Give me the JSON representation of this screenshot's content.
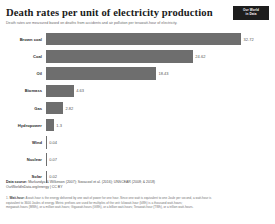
{
  "header": {
    "title": "Death rates per unit of electricity production",
    "subtitle": "Death rates are measured based on deaths from accidents and air pollution per terawatt-hour of electricity.",
    "logo_line1": "Our World",
    "logo_line2": "in Data"
  },
  "chart_data": {
    "type": "bar",
    "orientation": "horizontal",
    "title": "Death rates per unit of electricity production",
    "subtitle": "Death rates are measured based on deaths from accidents and air pollution per terawatt-hour of electricity.",
    "xlabel": "",
    "ylabel": "",
    "grid": false,
    "legend": "none",
    "xlim": [
      0,
      32.72
    ],
    "bar_color": "#6e6e6e",
    "categories": [
      "Brown coal",
      "Coal",
      "Oil",
      "Biomass",
      "Gas",
      "Hydropower",
      "Wind",
      "Nuclear",
      "Solar"
    ],
    "values": [
      32.72,
      24.62,
      18.43,
      4.63,
      2.82,
      1.3,
      0.04,
      0.07,
      0.02
    ],
    "value_labels": [
      "32.72",
      "24.62",
      "18.43",
      "4.63",
      "2.82",
      "1.3",
      "0.04",
      "0.07",
      "0.02"
    ],
    "bars": [
      {
        "label": "Brown coal",
        "value": 32.72,
        "value_label": "32.72"
      },
      {
        "label": "Coal",
        "value": 24.62,
        "value_label": "24.62"
      },
      {
        "label": "Oil",
        "value": 18.43,
        "value_label": "18.43"
      },
      {
        "label": "Biomass",
        "value": 4.63,
        "value_label": "4.63"
      },
      {
        "label": "Gas",
        "value": 2.82,
        "value_label": "2.82"
      },
      {
        "label": "Hydropower",
        "value": 1.3,
        "value_label": "1.3"
      },
      {
        "label": "Wind",
        "value": 0.04,
        "value_label": "0.04"
      },
      {
        "label": "Nuclear",
        "value": 0.07,
        "value_label": "0.07"
      },
      {
        "label": "Solar",
        "value": 0.02,
        "value_label": "0.02"
      }
    ]
  },
  "footer": {
    "source_prefix": "Data source:",
    "source_text": "Markandya & Wilkinson (2007); Sovacool et al. (2016); UNSCEAR (2008; & 2018)",
    "license": "OurWorldInData.org/energy | CC BY",
    "note_marker": "1.",
    "note_term": "Watt-hour:",
    "note_line1": "A watt-hour is the energy delivered by one watt of power for one hour. Since one watt is equivalent to one Joule per second, a watt-hour is",
    "note_line2": "equivalent to 3600 Joules of energy. Metric prefixes are used for multiples of the unit: kilowatt-hour (kWh) is a thousand watt-hours;",
    "note_line3": "megawatt-hours (MWh), or a million watt-hours; Gigawatt-hours (GWh), or a billion watt-hours; Terawatt-hour (TWh), or a trillion watt-hours."
  }
}
